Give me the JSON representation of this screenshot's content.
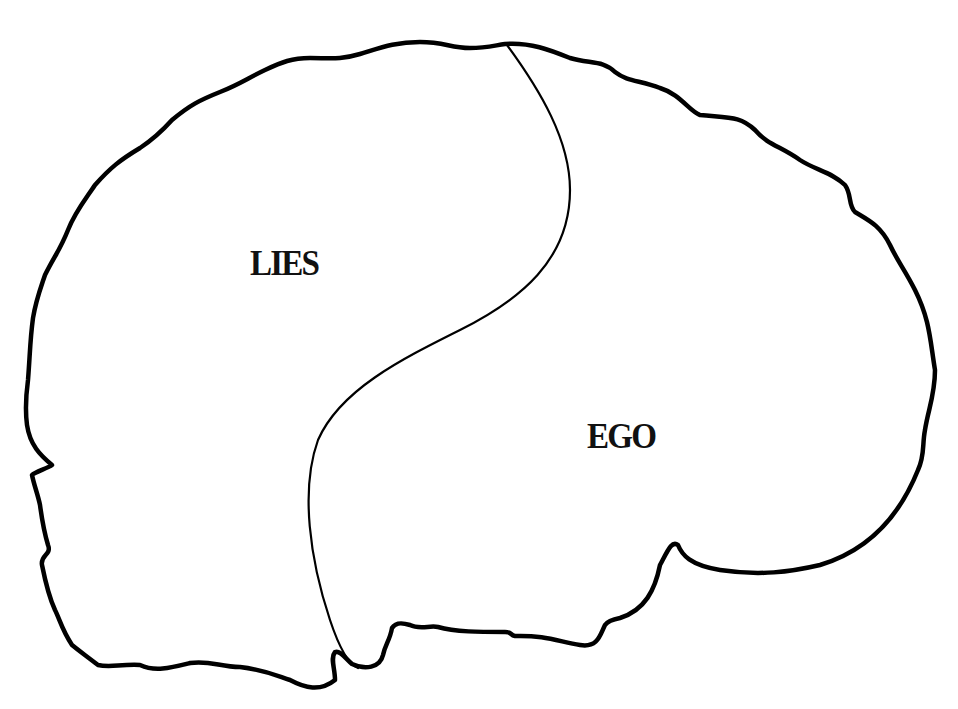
{
  "diagram": {
    "type": "brain-outline-two-regions",
    "outline_color": "#000000",
    "background": "#ffffff",
    "regions": [
      {
        "id": "left",
        "label": "LIES"
      },
      {
        "id": "right",
        "label": "EGO"
      }
    ]
  }
}
